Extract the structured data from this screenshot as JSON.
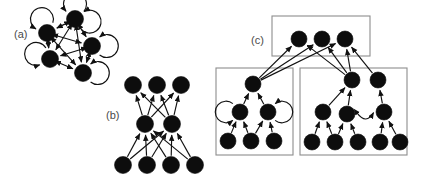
{
  "figure": {
    "background_color": "#ffffff",
    "node_color": "#0d0d0d",
    "edge_color": "#111111",
    "box_color": "#8d8d8d",
    "label_color": "#4a4a4a",
    "width": 423,
    "height": 186
  },
  "panels": [
    {
      "id": "a",
      "label": "(a)",
      "label_x": 14,
      "label_y": 38,
      "description": "dense strongly-connected digraph with self-loops",
      "node_radius": 8.5,
      "nodes": [
        {
          "id": "a1",
          "cx": 75,
          "cy": 19
        },
        {
          "id": "a2",
          "cx": 47,
          "cy": 33
        },
        {
          "id": "a3",
          "cx": 92,
          "cy": 46
        },
        {
          "id": "a4",
          "cx": 50,
          "cy": 59
        },
        {
          "id": "a5",
          "cx": 83,
          "cy": 73
        }
      ],
      "self_loops": [
        {
          "node": "a1",
          "angle": 270
        },
        {
          "node": "a1",
          "angle": 10
        },
        {
          "node": "a2",
          "angle": 250
        },
        {
          "node": "a3",
          "angle": 0
        },
        {
          "node": "a4",
          "angle": 200
        },
        {
          "node": "a5",
          "angle": 0
        }
      ],
      "edges": [
        {
          "from": "a1",
          "to": "a2",
          "bidirectional": true
        },
        {
          "from": "a1",
          "to": "a3",
          "bidirectional": true
        },
        {
          "from": "a1",
          "to": "a4",
          "bidirectional": true
        },
        {
          "from": "a1",
          "to": "a5",
          "bidirectional": true
        },
        {
          "from": "a2",
          "to": "a3",
          "bidirectional": true
        },
        {
          "from": "a2",
          "to": "a4",
          "bidirectional": true
        },
        {
          "from": "a2",
          "to": "a5",
          "bidirectional": true
        },
        {
          "from": "a3",
          "to": "a4",
          "bidirectional": true
        },
        {
          "from": "a3",
          "to": "a5",
          "bidirectional": true
        },
        {
          "from": "a4",
          "to": "a5",
          "bidirectional": true
        }
      ]
    },
    {
      "id": "b",
      "label": "(b)",
      "label_x": 106,
      "label_y": 119,
      "description": "three-layer digraph, bottom layer four nodes, middle layer two nodes, top layer three nodes",
      "node_radius": 8.5,
      "nodes": [
        {
          "id": "b_t1",
          "cx": 133,
          "cy": 85,
          "layer": "top"
        },
        {
          "id": "b_t2",
          "cx": 157,
          "cy": 85,
          "layer": "top"
        },
        {
          "id": "b_t3",
          "cx": 181,
          "cy": 85,
          "layer": "top"
        },
        {
          "id": "b_m1",
          "cx": 145,
          "cy": 124,
          "layer": "middle"
        },
        {
          "id": "b_m2",
          "cx": 172,
          "cy": 124,
          "layer": "middle"
        },
        {
          "id": "b_b1",
          "cx": 123,
          "cy": 165,
          "layer": "bottom"
        },
        {
          "id": "b_b2",
          "cx": 147,
          "cy": 165,
          "layer": "bottom"
        },
        {
          "id": "b_b3",
          "cx": 171,
          "cy": 165,
          "layer": "bottom"
        },
        {
          "id": "b_b4",
          "cx": 195,
          "cy": 165,
          "layer": "bottom"
        }
      ],
      "edges": [
        {
          "from": "b_m1",
          "to": "b_t1"
        },
        {
          "from": "b_m1",
          "to": "b_t2"
        },
        {
          "from": "b_m1",
          "to": "b_t3"
        },
        {
          "from": "b_m2",
          "to": "b_t1"
        },
        {
          "from": "b_m2",
          "to": "b_t2"
        },
        {
          "from": "b_m2",
          "to": "b_t3"
        },
        {
          "from": "b_b1",
          "to": "b_m1"
        },
        {
          "from": "b_b1",
          "to": "b_m2"
        },
        {
          "from": "b_b2",
          "to": "b_m1"
        },
        {
          "from": "b_b2",
          "to": "b_m2"
        },
        {
          "from": "b_b3",
          "to": "b_m1"
        },
        {
          "from": "b_b3",
          "to": "b_m2"
        },
        {
          "from": "b_b4",
          "to": "b_m1"
        },
        {
          "from": "b_b4",
          "to": "b_m2"
        }
      ]
    },
    {
      "id": "c",
      "label": "(c)",
      "label_x": 251,
      "label_y": 44,
      "description": "clustered condensation graph: a top cluster of three nodes fed by two lower clusters",
      "node_radius": 8.0,
      "boxes": [
        {
          "id": "c_box_top",
          "x": 272,
          "y": 16,
          "width": 98,
          "height": 40
        },
        {
          "id": "c_box_left",
          "x": 216,
          "y": 68,
          "width": 77,
          "height": 87
        },
        {
          "id": "c_box_right",
          "x": 300,
          "y": 68,
          "width": 107,
          "height": 87
        }
      ],
      "nodes": [
        {
          "id": "c_top1",
          "cx": 299,
          "cy": 39,
          "box": "c_box_top"
        },
        {
          "id": "c_top2",
          "cx": 322,
          "cy": 39,
          "box": "c_box_top"
        },
        {
          "id": "c_top3",
          "cx": 345,
          "cy": 39,
          "box": "c_box_top"
        },
        {
          "id": "c_l_root",
          "cx": 253,
          "cy": 84,
          "box": "c_box_left"
        },
        {
          "id": "c_l_m1",
          "cx": 240,
          "cy": 112,
          "box": "c_box_left"
        },
        {
          "id": "c_l_m2",
          "cx": 268,
          "cy": 112,
          "box": "c_box_left"
        },
        {
          "id": "c_l_b1",
          "cx": 228,
          "cy": 141,
          "box": "c_box_left"
        },
        {
          "id": "c_l_b2",
          "cx": 251,
          "cy": 141,
          "box": "c_box_left"
        },
        {
          "id": "c_l_b3",
          "cx": 274,
          "cy": 141,
          "box": "c_box_left"
        },
        {
          "id": "c_r_t1",
          "cx": 352,
          "cy": 80,
          "box": "c_box_right"
        },
        {
          "id": "c_r_t2",
          "cx": 378,
          "cy": 80,
          "box": "c_box_right"
        },
        {
          "id": "c_r_m1",
          "cx": 323,
          "cy": 112,
          "box": "c_box_right"
        },
        {
          "id": "c_r_m2",
          "cx": 347,
          "cy": 114,
          "box": "c_box_right"
        },
        {
          "id": "c_r_m3",
          "cx": 384,
          "cy": 112,
          "box": "c_box_right"
        },
        {
          "id": "c_r_b1",
          "cx": 312,
          "cy": 142,
          "box": "c_box_right"
        },
        {
          "id": "c_r_b2",
          "cx": 335,
          "cy": 142,
          "box": "c_box_right"
        },
        {
          "id": "c_r_b3",
          "cx": 358,
          "cy": 142,
          "box": "c_box_right"
        },
        {
          "id": "c_r_b4",
          "cx": 380,
          "cy": 142,
          "box": "c_box_right"
        },
        {
          "id": "c_r_b5",
          "cx": 400,
          "cy": 142,
          "box": "c_box_right"
        }
      ],
      "self_loops": [
        {
          "node": "c_l_m1",
          "angle": 180
        },
        {
          "node": "c_l_m2",
          "angle": 0
        }
      ],
      "edges": [
        {
          "from": "c_l_root",
          "to": "c_top1"
        },
        {
          "from": "c_l_root",
          "to": "c_top2"
        },
        {
          "from": "c_l_root",
          "to": "c_top3"
        },
        {
          "from": "c_l_m1",
          "to": "c_l_root"
        },
        {
          "from": "c_l_m2",
          "to": "c_l_root"
        },
        {
          "from": "c_l_b1",
          "to": "c_l_m1"
        },
        {
          "from": "c_l_b2",
          "to": "c_l_m1"
        },
        {
          "from": "c_l_b2",
          "to": "c_l_m2"
        },
        {
          "from": "c_l_b3",
          "to": "c_l_m2"
        },
        {
          "from": "c_r_t1",
          "to": "c_top1"
        },
        {
          "from": "c_r_t1",
          "to": "c_top2"
        },
        {
          "from": "c_r_t1",
          "to": "c_top3"
        },
        {
          "from": "c_r_t2",
          "to": "c_top3"
        },
        {
          "from": "c_r_m1",
          "to": "c_r_t1"
        },
        {
          "from": "c_r_m2",
          "to": "c_r_t1"
        },
        {
          "from": "c_r_m3",
          "to": "c_r_t2"
        },
        {
          "from": "c_r_m2",
          "to": "c_r_m3",
          "curved": true,
          "bidirectional": true
        },
        {
          "from": "c_r_b1",
          "to": "c_r_m1"
        },
        {
          "from": "c_r_b2",
          "to": "c_r_m1"
        },
        {
          "from": "c_r_b2",
          "to": "c_r_m2"
        },
        {
          "from": "c_r_b3",
          "to": "c_r_m2"
        },
        {
          "from": "c_r_b4",
          "to": "c_r_m3"
        },
        {
          "from": "c_r_b5",
          "to": "c_r_m3"
        }
      ]
    }
  ]
}
